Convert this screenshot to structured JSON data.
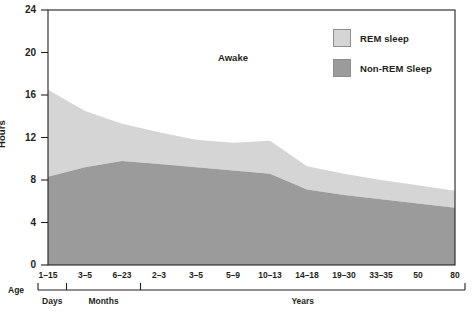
{
  "chart_data": {
    "type": "area",
    "title": "",
    "subtitle": "",
    "xlabel": "Age",
    "ylabel": "Hours",
    "ylim": [
      0,
      24
    ],
    "yticks": [
      0,
      4,
      8,
      12,
      16,
      20,
      24
    ],
    "grid": false,
    "stacked": true,
    "legend_position": "top-right",
    "categories": [
      "1–15",
      "3–5",
      "6–23",
      "2–3",
      "3–5",
      "5–9",
      "10–13",
      "14–18",
      "19–30",
      "33–35",
      "50",
      "80"
    ],
    "category_groups": [
      {
        "label": "Days",
        "categories": [
          "1–15"
        ]
      },
      {
        "label": "Months",
        "categories": [
          "3–5",
          "6–23"
        ]
      },
      {
        "label": "Years",
        "categories": [
          "2–3",
          "3–5",
          "5–9",
          "10–13",
          "14–18",
          "19–30",
          "33–35",
          "50",
          "80"
        ]
      }
    ],
    "series": [
      {
        "name": "Non-REM Sleep",
        "color": "#9b9b9b",
        "values": [
          8.3,
          9.2,
          9.8,
          9.5,
          9.2,
          8.9,
          8.6,
          7.1,
          6.6,
          6.2,
          5.8,
          5.4
        ]
      },
      {
        "name": "REM sleep",
        "color": "#d5d5d5",
        "values": [
          8.2,
          5.3,
          3.5,
          3.0,
          2.6,
          2.6,
          3.1,
          2.2,
          2.0,
          1.8,
          1.7,
          1.6
        ]
      }
    ],
    "series_totals": [
      16.5,
      14.5,
      13.3,
      12.5,
      11.8,
      11.5,
      11.7,
      9.3,
      8.6,
      8.0,
      7.5,
      7.0
    ],
    "annotations": [
      {
        "text": "Awake",
        "x_category": "5–9",
        "y_hours": 19.5
      }
    ],
    "legend": [
      {
        "label": "REM sleep",
        "color": "#d5d5d5"
      },
      {
        "label": "Non-REM Sleep",
        "color": "#9b9b9b"
      }
    ]
  },
  "axes": {
    "y_title": "Hours",
    "y_tick_labels": [
      "24",
      "20",
      "16",
      "12",
      "8",
      "4",
      "0"
    ],
    "x_axis_title": "Age",
    "x_tick_labels": [
      "1–15",
      "3–5",
      "6–23",
      "2–3",
      "3–5",
      "5–9",
      "10–13",
      "14–18",
      "19–30",
      "33–35",
      "50",
      "80"
    ],
    "x_group_labels": [
      "Days",
      "Months",
      "Years"
    ]
  },
  "annotation": {
    "awake": "Awake"
  },
  "legend": {
    "rem_label": "REM sleep",
    "nonrem_label": "Non-REM Sleep"
  },
  "colors": {
    "rem": "#d5d5d5",
    "nonrem": "#9b9b9b",
    "awake": "#ffffff",
    "axis": "#231f20",
    "frame": "#231f20"
  }
}
